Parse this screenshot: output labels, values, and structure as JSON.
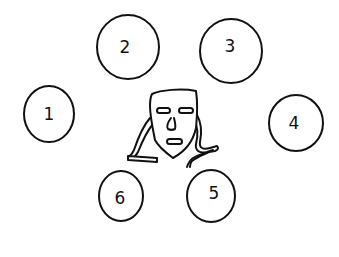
{
  "diagram": {
    "ink_color": "#111111",
    "background": "#ffffff",
    "center_figure": "mask-face",
    "circles": [
      {
        "label": "1",
        "cx": 49,
        "cy": 114,
        "rx": 25,
        "ry": 28
      },
      {
        "label": "2",
        "cx": 128,
        "cy": 47,
        "rx": 31,
        "ry": 32
      },
      {
        "label": "3",
        "cx": 231,
        "cy": 51,
        "rx": 31,
        "ry": 32
      },
      {
        "label": "4",
        "cx": 296,
        "cy": 123,
        "rx": 27,
        "ry": 28
      },
      {
        "label": "5",
        "cx": 211,
        "cy": 196,
        "rx": 24,
        "ry": 26
      },
      {
        "label": "6",
        "cx": 121,
        "cy": 196,
        "rx": 22,
        "ry": 25
      }
    ]
  }
}
